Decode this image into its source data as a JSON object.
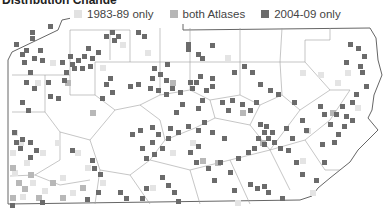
{
  "title": "Distribution Change",
  "legend": {
    "items": [
      {
        "label": "1983-89 only",
        "color": "#e2e2e2"
      },
      {
        "label": "both Atlases",
        "color": "#b6b6b6"
      },
      {
        "label": "2004-09 only",
        "color": "#6b6b6b"
      }
    ]
  },
  "map": {
    "region": "Pennsylvania",
    "outline_color": "#666666",
    "county_line_color": "#9a9a9a",
    "background": "#ffffff"
  }
}
